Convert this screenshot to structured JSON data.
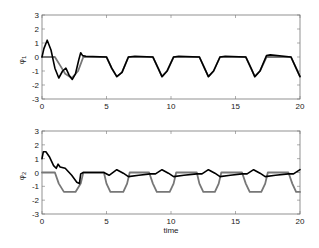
{
  "chart_data": [
    {
      "type": "line",
      "title": "",
      "xlabel": "",
      "ylabel": "φ1",
      "ylabel_main": "φ",
      "ylabel_sub": "1",
      "xlim": [
        0,
        20
      ],
      "ylim": [
        -3,
        3
      ],
      "xticks": [
        0,
        5,
        10,
        15,
        20
      ],
      "yticks": [
        3,
        2,
        1,
        0,
        -1,
        -2,
        -3
      ],
      "grid": false,
      "legend": null,
      "series": [
        {
          "name": "reference",
          "color": "#777777",
          "x": [
            0,
            1.0,
            1.4,
            1.8,
            2.3,
            2.8,
            3.2,
            5.0,
            5.4,
            5.8,
            6.2,
            6.7,
            8.6,
            9.0,
            9.3,
            9.7,
            10.2,
            12.2,
            12.6,
            12.9,
            13.3,
            13.8,
            15.8,
            16.2,
            16.5,
            16.9,
            17.4,
            19.3,
            19.7,
            20.0
          ],
          "y": [
            0,
            0,
            -0.6,
            -1.2,
            -1.5,
            -1.0,
            0,
            0,
            -0.8,
            -1.4,
            -1.1,
            0,
            0,
            -0.8,
            -1.4,
            -1.0,
            0,
            0,
            -0.8,
            -1.4,
            -1.0,
            0,
            0,
            -0.8,
            -1.4,
            -1.0,
            0,
            0,
            -0.8,
            -1.4
          ]
        },
        {
          "name": "actual",
          "color": "#000000",
          "x": [
            0,
            0.15,
            0.4,
            0.7,
            1.0,
            1.3,
            1.6,
            1.85,
            2.1,
            2.35,
            2.6,
            2.85,
            3.0,
            3.15,
            3.4,
            5.0,
            5.4,
            5.8,
            6.2,
            6.7,
            7.2,
            8.6,
            9.0,
            9.3,
            9.7,
            10.2,
            10.6,
            12.2,
            12.6,
            12.9,
            13.3,
            13.8,
            14.2,
            15.8,
            16.2,
            16.5,
            16.9,
            17.4,
            17.7,
            19.3,
            19.7,
            20.0
          ],
          "y": [
            0,
            0.6,
            1.2,
            0.5,
            -0.8,
            -1.5,
            -1.0,
            -0.8,
            -1.3,
            -1.6,
            -1.2,
            -0.2,
            0.3,
            0.1,
            0.05,
            0,
            -0.8,
            -1.4,
            -1.1,
            0,
            0.05,
            0,
            -0.8,
            -1.4,
            -1.0,
            0,
            0.05,
            0,
            -0.8,
            -1.4,
            -1.0,
            0,
            0.05,
            0,
            -0.8,
            -1.4,
            -1.0,
            0.1,
            0.15,
            0,
            -0.8,
            -1.4
          ]
        }
      ]
    },
    {
      "type": "line",
      "title": "",
      "xlabel": "time",
      "ylabel": "φ2",
      "ylabel_main": "φ",
      "ylabel_sub": "2",
      "xlim": [
        0,
        20
      ],
      "ylim": [
        -3,
        3
      ],
      "xticks": [
        0,
        5,
        10,
        15,
        20
      ],
      "yticks": [
        3,
        2,
        1,
        0,
        -1,
        -2,
        -3
      ],
      "grid": false,
      "legend": null,
      "series": [
        {
          "name": "reference",
          "color": "#777777",
          "x": [
            0,
            1.0,
            1.3,
            1.7,
            2.6,
            3.0,
            3.2,
            4.8,
            5.0,
            5.3,
            6.3,
            6.6,
            6.8,
            8.3,
            8.6,
            8.9,
            9.9,
            10.2,
            10.4,
            12.0,
            12.2,
            12.5,
            13.4,
            13.7,
            13.9,
            15.5,
            15.8,
            16.1,
            17.0,
            17.3,
            17.5,
            19.1,
            19.4,
            19.7,
            20.0
          ],
          "y": [
            0,
            0,
            -0.8,
            -1.4,
            -1.4,
            -0.8,
            0,
            0,
            -0.8,
            -1.4,
            -1.4,
            -0.8,
            0,
            0,
            -0.8,
            -1.4,
            -1.4,
            -0.8,
            0,
            0,
            -0.8,
            -1.4,
            -1.4,
            -0.8,
            0,
            0,
            -0.8,
            -1.4,
            -1.4,
            -0.8,
            0,
            0,
            -0.8,
            -1.4,
            -1.4
          ]
        },
        {
          "name": "actual",
          "color": "#000000",
          "x": [
            0,
            0.1,
            0.3,
            0.6,
            0.9,
            1.1,
            1.25,
            1.4,
            1.8,
            2.3,
            2.7,
            2.9,
            3.0,
            3.2,
            4.8,
            5.2,
            5.8,
            6.3,
            6.7,
            7.5,
            8.4,
            8.8,
            9.3,
            9.8,
            10.2,
            11.0,
            12.0,
            12.4,
            12.9,
            13.4,
            13.8,
            14.6,
            15.5,
            15.9,
            16.4,
            16.9,
            17.3,
            18.1,
            19.1,
            19.5,
            20.0
          ],
          "y": [
            1.0,
            1.5,
            1.5,
            1.1,
            0.5,
            0.3,
            0.6,
            0.4,
            0.3,
            -0.2,
            -0.7,
            -0.8,
            -0.1,
            0,
            0,
            -0.2,
            0.2,
            -0.05,
            -0.3,
            -0.2,
            -0.1,
            -0.1,
            0.2,
            -0.05,
            -0.3,
            -0.2,
            -0.1,
            -0.1,
            0.2,
            -0.05,
            -0.3,
            -0.2,
            -0.1,
            -0.1,
            0.2,
            -0.05,
            -0.3,
            -0.2,
            -0.1,
            -0.1,
            0.2
          ]
        }
      ]
    }
  ],
  "plots": [
    {
      "ylabel_main": "φ",
      "ylabel_sub": "1",
      "xtick_labels": [
        "0",
        "5",
        "10",
        "15",
        "20"
      ],
      "ytick_labels": [
        "3",
        "2",
        "1",
        "0",
        "-1",
        "-2",
        "-3"
      ]
    },
    {
      "ylabel_main": "φ",
      "ylabel_sub": "2",
      "xlabel": "time",
      "xtick_labels": [
        "0",
        "5",
        "10",
        "15",
        "20"
      ],
      "ytick_labels": [
        "3",
        "2",
        "1",
        "0",
        "-1",
        "-2",
        "-3"
      ]
    }
  ]
}
